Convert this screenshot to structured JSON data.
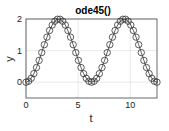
{
  "chart_data": {
    "type": "line",
    "title": "ode45()",
    "xlabel": "t",
    "ylabel": "y",
    "xlim": [
      0,
      12.566
    ],
    "ylim": [
      -0.5,
      2
    ],
    "xticks": [
      0,
      5,
      10
    ],
    "yticks": [
      0,
      1,
      2
    ],
    "xtick_labels": [
      "0",
      "5",
      "10"
    ],
    "ytick_labels": [
      "0",
      "1",
      "2"
    ],
    "grid": true,
    "marker": "circle",
    "line_style": "solid",
    "color": "#333333",
    "series": [
      {
        "name": "y",
        "description": "y = 1 - cos(t), solution points from ode45",
        "x": [
          0,
          0.251,
          0.503,
          0.754,
          1.005,
          1.257,
          1.508,
          1.759,
          2.011,
          2.262,
          2.513,
          2.765,
          3.016,
          3.267,
          3.519,
          3.77,
          4.021,
          4.273,
          4.524,
          4.775,
          5.027,
          5.278,
          5.529,
          5.781,
          6.032,
          6.283,
          6.535,
          6.786,
          7.037,
          7.288,
          7.54,
          7.791,
          8.042,
          8.294,
          8.545,
          8.796,
          9.048,
          9.299,
          9.55,
          9.802,
          10.053,
          10.304,
          10.556,
          10.807,
          11.058,
          11.31,
          11.561,
          11.812,
          12.064,
          12.315,
          12.566
        ],
        "values": [
          0.0,
          0.031,
          0.124,
          0.271,
          0.464,
          0.691,
          0.937,
          1.187,
          1.426,
          1.637,
          1.809,
          1.93,
          1.992,
          1.992,
          1.93,
          1.809,
          1.637,
          1.426,
          1.187,
          0.937,
          0.691,
          0.464,
          0.271,
          0.124,
          0.031,
          0.0,
          0.031,
          0.124,
          0.271,
          0.464,
          0.691,
          0.937,
          1.187,
          1.426,
          1.637,
          1.809,
          1.93,
          1.992,
          1.992,
          1.93,
          1.809,
          1.637,
          1.426,
          1.187,
          0.937,
          0.691,
          0.464,
          0.271,
          0.124,
          0.031,
          0.0
        ]
      }
    ]
  }
}
